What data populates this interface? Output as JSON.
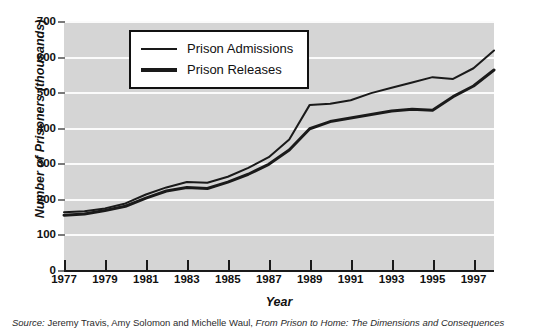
{
  "chart_data": {
    "type": "line",
    "title": "",
    "xlabel": "Year",
    "ylabel": "Number of Prisoners (thousands)",
    "xlim": [
      1977,
      1998
    ],
    "ylim": [
      0,
      700
    ],
    "grid": true,
    "legend_position": "top-left-inside",
    "y_ticks": [
      700,
      600,
      500,
      400,
      300,
      200,
      100,
      0
    ],
    "x_ticks": [
      1977,
      1979,
      1981,
      1983,
      1985,
      1987,
      1989,
      1991,
      1993,
      1995,
      1997
    ],
    "x": [
      1977,
      1978,
      1979,
      1980,
      1981,
      1982,
      1983,
      1984,
      1985,
      1986,
      1987,
      1988,
      1989,
      1990,
      1991,
      1992,
      1993,
      1994,
      1995,
      1996,
      1997,
      1998
    ],
    "series": [
      {
        "name": "Prison Admissions",
        "color": "#1a1a1a",
        "line_width": 2,
        "values": [
          165,
          168,
          176,
          190,
          215,
          235,
          250,
          248,
          265,
          290,
          320,
          370,
          467,
          470,
          480,
          500,
          515,
          530,
          545,
          540,
          570,
          620
        ]
      },
      {
        "name": "Prison Releases",
        "color": "#1a1a1a",
        "line_width": 3,
        "values": [
          157,
          160,
          170,
          182,
          205,
          225,
          235,
          232,
          250,
          272,
          300,
          340,
          400,
          420,
          430,
          440,
          450,
          455,
          452,
          490,
          520,
          565
        ]
      }
    ]
  },
  "legend": {
    "items": [
      {
        "label": "Prison Admissions",
        "style": "thin"
      },
      {
        "label": "Prison Releases",
        "style": "thick"
      }
    ]
  },
  "source": {
    "label": "Source:",
    "authors": " Jeremy Travis, Amy Solomon and Michelle Waul, ",
    "title": "From Prison to Home: The Dimensions and Consequences"
  }
}
